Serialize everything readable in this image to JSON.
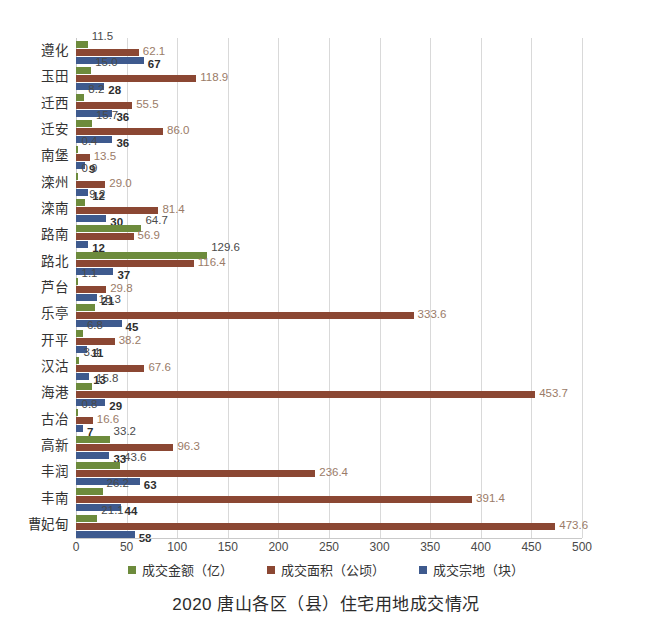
{
  "chart_data": {
    "type": "bar",
    "orientation": "horizontal",
    "title": "2020 唐山各区（县）住宅用地成交情况",
    "xlabel": "",
    "ylabel": "",
    "xlim": [
      0,
      500
    ],
    "xticks": [
      0,
      50,
      100,
      150,
      200,
      250,
      300,
      350,
      400,
      450,
      500
    ],
    "grid": true,
    "legend_position": "bottom",
    "categories": [
      "遵化",
      "玉田",
      "迁西",
      "迁安",
      "南堡",
      "滦州",
      "滦南",
      "路南",
      "路北",
      "芦台",
      "乐亭",
      "开平",
      "汉沽",
      "海港",
      "古冶",
      "高新",
      "丰润",
      "丰南",
      "曹妃甸"
    ],
    "series": [
      {
        "name": "成交金额（亿）",
        "color": "#6d8b3c",
        "values": [
          11.5,
          15.0,
          8.2,
          15.7,
          0.4,
          0.9,
          9.2,
          64.7,
          129.6,
          1.1,
          18.3,
          6.8,
          3.4,
          15.8,
          0.8,
          33.2,
          43.6,
          26.2,
          21.1
        ],
        "labels": [
          "11.5",
          "15.0",
          "8.2",
          "15.7",
          "0.4",
          "0.9",
          "9.2",
          "64.7",
          "129.6",
          "1.1",
          "18.3",
          "6.8",
          "3.4",
          "15.8",
          "0.8",
          "33.2",
          "43.6",
          "26.2",
          "21.1"
        ]
      },
      {
        "name": "成交面积（公顷）",
        "color": "#8b4733",
        "values": [
          62.1,
          118.9,
          55.5,
          86.0,
          13.5,
          29.0,
          81.4,
          56.9,
          116.4,
          29.8,
          333.6,
          38.2,
          67.6,
          453.7,
          16.6,
          96.3,
          236.4,
          391.4,
          473.6
        ],
        "labels": [
          "62.1",
          "118.9",
          "55.5",
          "86.0",
          "13.5",
          "29.0",
          "81.4",
          "56.9",
          "116.4",
          "29.8",
          "333.6",
          "38.2",
          "67.6",
          "453.7",
          "16.6",
          "96.3",
          "236.4",
          "391.4",
          "473.6"
        ]
      },
      {
        "name": "成交宗地（块）",
        "color": "#3e5a8e",
        "values": [
          67,
          28,
          36,
          36,
          9,
          12,
          30,
          12,
          37,
          21,
          45,
          11,
          13,
          29,
          7,
          33,
          63,
          44,
          58
        ],
        "labels": [
          "67",
          "28",
          "36",
          "36",
          "9",
          "12",
          "30",
          "12",
          "37",
          "21",
          "45",
          "11",
          "13",
          "29",
          "7",
          "33",
          "63",
          "44",
          "58"
        ]
      }
    ]
  },
  "legend": {
    "items": [
      {
        "label": "成交金额（亿）",
        "color": "#6d8b3c"
      },
      {
        "label": "成交面积（公顷）",
        "color": "#8b4733"
      },
      {
        "label": "成交宗地（块）",
        "color": "#3e5a8e"
      }
    ]
  },
  "title": "2020 唐山各区（县）住宅用地成交情况"
}
